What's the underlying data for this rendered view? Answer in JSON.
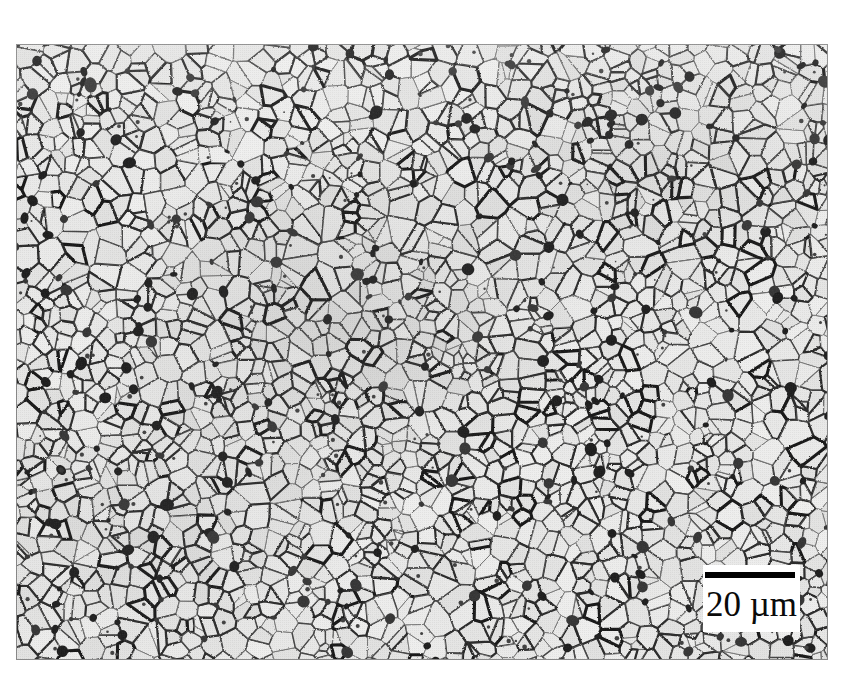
{
  "figure": {
    "kind": "optical-micrograph",
    "specimen": "polygonal ferrite with dispersed dark second-phase (pearlite/carbide) particles",
    "background_color": "#ffffff",
    "plate": {
      "x": 16,
      "y": 44,
      "width": 812,
      "height": 616,
      "border_color": "#9a9a9a",
      "matrix_color": "#f4f4f2",
      "boundary_color": "#1a1a1a"
    }
  },
  "scalebar": {
    "label": "20 µm",
    "value": 20,
    "unit": "µm",
    "bar_length_px": 90,
    "bar_thickness_px": 6,
    "bar_color": "#000000",
    "box_color": "#ffffff",
    "position": "bottom-right"
  }
}
